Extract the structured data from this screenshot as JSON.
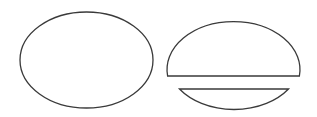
{
  "diagram": {
    "stroke_color": "#3a3a3a",
    "fill_color": "#ffffff",
    "shapes": [
      {
        "name": "whole-ellipse",
        "cx": 86.5,
        "cy": 60,
        "rx": 66.5,
        "ry": 48
      },
      {
        "name": "cut-ellipse-upper-part",
        "cx": 233.5,
        "cy": 61,
        "rx": 66.5,
        "ry": 48,
        "cut_y": 76
      },
      {
        "name": "cut-ellipse-lower-part",
        "cx": 233.5,
        "cy": 62,
        "rx": 66.5,
        "ry": 48,
        "cut_y": 89
      }
    ]
  }
}
